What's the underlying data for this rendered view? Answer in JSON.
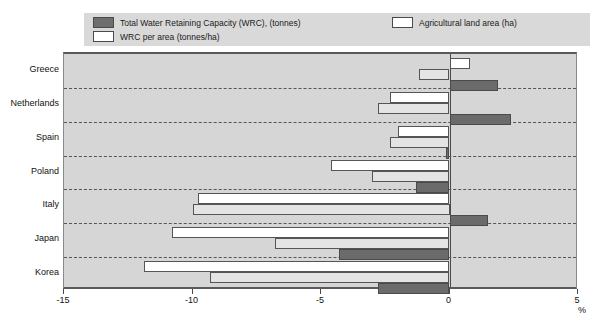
{
  "legend": {
    "items": [
      {
        "label": "Total Water Retaining Capacity (WRC), (tonnes)",
        "swatch": "dark-swatch-icon",
        "key": "total"
      },
      {
        "label": "WRC per area (tonnes/ha)",
        "swatch": "white-swatch-icon",
        "key": "perarea"
      },
      {
        "label": "Agricultural land area (ha)",
        "swatch": "white-swatch-icon",
        "key": "agri"
      }
    ]
  },
  "axis": {
    "unit_label": "%",
    "tick_labels": [
      "-15",
      "-10",
      "-5",
      "0",
      "5"
    ]
  },
  "chart_data": {
    "type": "bar",
    "orientation": "horizontal",
    "title": "",
    "xlabel": "%",
    "ylabel": "",
    "xlim": [
      -15,
      5
    ],
    "xticks": [
      -15,
      -10,
      -5,
      0,
      5
    ],
    "grid": false,
    "legend_position": "top",
    "categories": [
      "Greece",
      "Netherlands",
      "Spain",
      "Poland",
      "Italy",
      "Japan",
      "Korea"
    ],
    "series": [
      {
        "name": "Agricultural land area (ha)",
        "key": "agri",
        "color": "#ffffff",
        "values": [
          0.8,
          -2.3,
          -2.0,
          -4.6,
          -9.8,
          -10.8,
          -11.9
        ]
      },
      {
        "name": "WRC per area (tonnes/ha)",
        "key": "perarea",
        "color": "#e4e4e4",
        "values": [
          -1.2,
          -2.8,
          -2.3,
          -3.0,
          -10.0,
          -6.8,
          -9.3
        ]
      },
      {
        "name": "Total Water Retaining Capacity (WRC), (tonnes)",
        "key": "total",
        "color": "#6b6b6b",
        "values": [
          1.9,
          2.4,
          -0.15,
          -1.3,
          1.5,
          -4.3,
          -2.8
        ]
      }
    ]
  },
  "colors": {
    "plot_background": "#d6d6d6",
    "legend_background": "#d9d9d9",
    "axis": "#4a4a4a",
    "separator": "#555555"
  }
}
